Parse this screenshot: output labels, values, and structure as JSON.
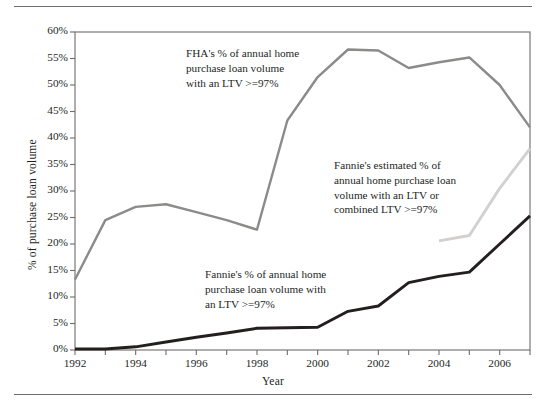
{
  "figure": {
    "top_rule": "horizontal-rule",
    "bottom_rule": "horizontal-rule"
  },
  "annotations": {
    "fha": "FHA's % of annual home\npurchase loan volume\nwith an LTV >=97%",
    "fannie_estimated": "Fannie's estimated % of\nannual home purchase loan\nvolume with an LTV or\ncombined LTV >=97%",
    "fannie": "Fannie's % of annual home\npurchase loan volume with\nan LTV >=97%"
  },
  "colors": {
    "fha_line": "#8d8b89",
    "fannie_line": "#231f1e",
    "fannie_estimated_line": "#d3d1cf",
    "axis": "#6f6c6b",
    "text": "#231f1e"
  },
  "chart_data": {
    "type": "line",
    "title": "",
    "xlabel": "Year",
    "ylabel": "% of purchase loan volume",
    "xlim": [
      1992,
      2007
    ],
    "ylim": [
      0,
      60
    ],
    "grid": false,
    "legend_position": "inline-annotations",
    "y_tick_labels": [
      "0%",
      "5%",
      "10%",
      "15%",
      "20%",
      "25%",
      "30%",
      "35%",
      "40%",
      "45%",
      "50%",
      "55%",
      "60%"
    ],
    "y_tick_values": [
      0,
      5,
      10,
      15,
      20,
      25,
      30,
      35,
      40,
      45,
      50,
      55,
      60
    ],
    "x_tick_values": [
      1992,
      1993,
      1994,
      1995,
      1996,
      1997,
      1998,
      1999,
      2000,
      2001,
      2002,
      2003,
      2004,
      2005,
      2006,
      2007
    ],
    "x_tick_labels": [
      "1992",
      "",
      "1994",
      "",
      "1996",
      "",
      "1998",
      "",
      "2000",
      "",
      "2002",
      "",
      "2004",
      "",
      "2006",
      ""
    ],
    "x_labeled_ticks": [
      1992,
      1994,
      1996,
      1998,
      2000,
      2002,
      2004,
      2006
    ],
    "series": [
      {
        "name": "FHA's % of annual home purchase loan volume with an LTV >=97%",
        "color": "#8d8b89",
        "x": [
          1992,
          1993,
          1994,
          1995,
          1996,
          1997,
          1998,
          1999,
          2000,
          2001,
          2002,
          2003,
          2004,
          2005,
          2006,
          2007
        ],
        "values": [
          13.3,
          24.5,
          27.0,
          27.5,
          26.0,
          24.5,
          22.7,
          43.3,
          51.5,
          56.7,
          56.5,
          53.2,
          54.3,
          55.2,
          50.0,
          42.0
        ]
      },
      {
        "name": "Fannie's % of annual home purchase loan volume with an LTV >=97%",
        "color": "#231f1e",
        "x": [
          1992,
          1993,
          1994,
          1995,
          1996,
          1997,
          1998,
          1999,
          2000,
          2001,
          2002,
          2003,
          2004,
          2005,
          2006,
          2007
        ],
        "values": [
          0.2,
          0.2,
          0.6,
          1.5,
          2.4,
          3.2,
          4.1,
          4.2,
          4.3,
          7.3,
          8.3,
          12.7,
          13.9,
          14.7,
          20.0,
          25.3
        ]
      },
      {
        "name": "Fannie's estimated % of annual home purchase loan volume with an LTV or combined LTV >=97%",
        "color": "#d3d1cf",
        "x": [
          2004,
          2005,
          2006,
          2007
        ],
        "values": [
          20.6,
          21.6,
          30.5,
          38.0
        ]
      }
    ]
  }
}
